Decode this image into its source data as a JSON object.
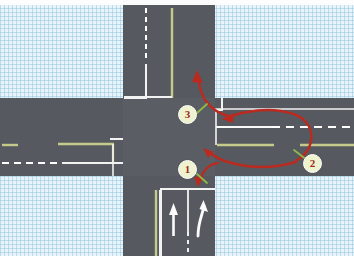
{
  "diagram": {
    "canvas": {
      "width": 354,
      "height": 256
    },
    "colors": {
      "background_grid": "#e9f4fa",
      "grid_line": "#96c8de",
      "road": "#565a60",
      "lane_white": "#ffffff",
      "edge_yellow": "#c5c98a",
      "arrow_red": "#c0281e",
      "badge_fill": "#eef2cf",
      "badge_text": "#9d2a22",
      "leader_line": "#8fb84a"
    },
    "roads": [
      {
        "name": "vertical-road",
        "orientation": "vertical"
      },
      {
        "name": "horizontal-road",
        "orientation": "horizontal"
      }
    ],
    "markers": [
      {
        "id": "1",
        "label": "1",
        "x": 186,
        "y": 168,
        "note": "start of right-turn path from southbound approach"
      },
      {
        "id": "2",
        "label": "2",
        "x": 310,
        "y": 162,
        "note": "U-turn path on eastern arm"
      },
      {
        "id": "3",
        "label": "3",
        "x": 186,
        "y": 113,
        "note": "exit northbound after U-turn"
      }
    ],
    "lane_arrows": [
      {
        "name": "straight-ahead-arrow",
        "type": "straight"
      },
      {
        "name": "right-turn-arrow",
        "type": "curve-right"
      }
    ],
    "path_arrows": [
      {
        "name": "entry-arrow",
        "direction": "down-left"
      },
      {
        "name": "turn-arrow",
        "direction": "up-left"
      },
      {
        "name": "uturn-arrow",
        "direction": "left"
      },
      {
        "name": "exit-arrow",
        "direction": "up"
      }
    ]
  }
}
